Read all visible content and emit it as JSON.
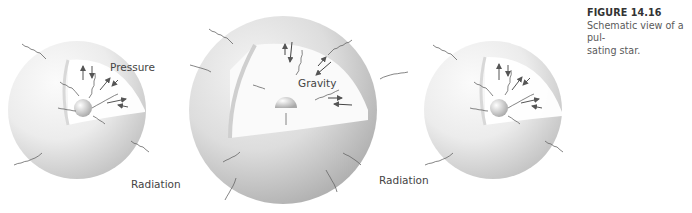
{
  "figure": {
    "number": "FIGURE 14.16",
    "caption_line1": "Schematic view of a pul-",
    "caption_line2": "sating star."
  },
  "labels": {
    "pressure": "Pressure",
    "gravity": "Gravity",
    "radiation_left": "Radiation",
    "radiation_center": "Radiation"
  },
  "stars": [
    {
      "name": "contracted-star-left",
      "state": "small"
    },
    {
      "name": "expanded-star-center",
      "state": "large"
    },
    {
      "name": "contracted-star-right",
      "state": "small"
    }
  ],
  "colors": {
    "sphere_light": "#f4f4f4",
    "sphere_shadow": "#c8c8c8",
    "arrow": "#555555",
    "text": "#444444"
  }
}
